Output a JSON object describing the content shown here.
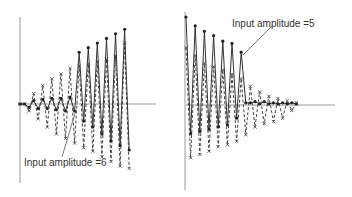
{
  "chart_data": [
    {
      "type": "line",
      "title": "",
      "xlabel": "",
      "ylabel": "",
      "grid": false,
      "annotation": "Input amplitude =6",
      "description": "Growing oscillation: response builds up over time",
      "x": [
        0,
        1,
        2,
        3,
        4,
        5,
        6,
        7,
        8,
        9,
        10,
        11,
        12,
        13,
        14,
        15,
        16,
        17,
        18,
        19,
        20,
        21,
        22,
        23,
        24
      ],
      "series": [
        {
          "name": "solid (dots)",
          "style": "solid",
          "marker": "dot",
          "values": [
            0,
            0,
            -0.3,
            0.3,
            -0.4,
            0.4,
            -0.4,
            0.5,
            -0.5,
            0.5,
            -0.6,
            0.6,
            -0.6,
            4.5,
            -1.5,
            4.9,
            -2.0,
            5.3,
            -2.6,
            5.7,
            -3.2,
            6.1,
            -3.6,
            6.5,
            -4.0
          ]
        },
        {
          "name": "dashed (crosses)",
          "style": "dashed",
          "marker": "cross",
          "values": [
            0,
            0,
            -0.6,
            0.9,
            -1.3,
            1.6,
            -2.0,
            2.2,
            -2.6,
            2.6,
            -3.0,
            3.1,
            -3.4,
            3.3,
            -3.8,
            3.5,
            -4.1,
            3.7,
            -4.6,
            3.9,
            -5.0,
            4.2,
            -5.4,
            5.3,
            -5.6
          ]
        }
      ]
    },
    {
      "type": "line",
      "title": "",
      "xlabel": "",
      "ylabel": "",
      "grid": false,
      "annotation": "Input amplitude =5",
      "description": "Decaying oscillation: response dies out over time",
      "x": [
        0,
        1,
        2,
        3,
        4,
        5,
        6,
        7,
        8,
        9,
        10,
        11,
        12,
        13,
        14,
        15,
        16,
        17,
        18,
        19,
        20,
        21,
        22,
        23,
        24
      ],
      "series": [
        {
          "name": "solid (dots)",
          "style": "solid",
          "marker": "dot",
          "values": [
            8.0,
            -2.6,
            7.2,
            -2.4,
            6.7,
            -2.2,
            6.3,
            -2.0,
            5.8,
            -1.8,
            5.6,
            -1.2,
            4.8,
            0.2,
            0.2,
            0.3,
            0.1,
            0.3,
            0.1,
            0.2,
            0.1,
            0.2,
            0.1,
            0.2,
            0.1
          ]
        },
        {
          "name": "dashed (crosses)",
          "style": "dashed",
          "marker": "cross",
          "values": [
            5.2,
            -4.8,
            4.5,
            -4.5,
            3.8,
            -4.2,
            3.5,
            -3.8,
            3.2,
            -3.6,
            2.8,
            -3.3,
            2.4,
            -2.7,
            1.7,
            -2.0,
            1.2,
            -1.7,
            0.8,
            -1.5,
            0.6,
            -1.2,
            0.4,
            -0.5,
            0.2
          ]
        }
      ]
    }
  ],
  "labels": {
    "left_annotation": "Input amplitude =6",
    "right_annotation": "Input amplitude =5"
  }
}
